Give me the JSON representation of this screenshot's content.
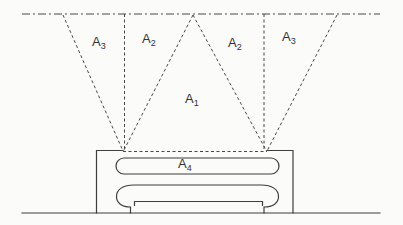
{
  "figure": {
    "kind": "radiator-view-factor-diagram",
    "colors": {
      "ink": "#3f3f3f",
      "text": "#333333",
      "background": "#fbfbf9"
    },
    "labels": [
      {
        "name": "area-a3-left",
        "base": "A",
        "sub": "3"
      },
      {
        "name": "area-a2-left",
        "base": "A",
        "sub": "2"
      },
      {
        "name": "area-a1",
        "base": "A",
        "sub": "1"
      },
      {
        "name": "area-a2-right",
        "base": "A",
        "sub": "2"
      },
      {
        "name": "area-a3-right",
        "base": "A",
        "sub": "3"
      },
      {
        "name": "area-a4",
        "base": "A",
        "sub": "4"
      }
    ]
  }
}
